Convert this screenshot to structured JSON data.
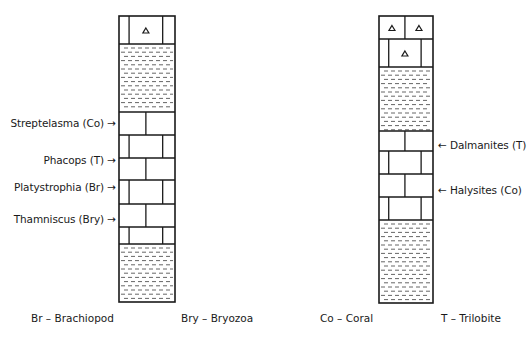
{
  "diagram": {
    "type": "stratigraphic-columns",
    "colors": {
      "line": "#1a1a1a",
      "shale_dash": "#555555",
      "background": "#ffffff"
    }
  },
  "columns": [
    {
      "id": "left",
      "layers": [
        {
          "rock": "limestone",
          "fossil_marker": true
        },
        {
          "rock": "shale"
        },
        {
          "rock": "limestone"
        },
        {
          "rock": "limestone"
        },
        {
          "rock": "limestone"
        },
        {
          "rock": "limestone"
        },
        {
          "rock": "limestone"
        },
        {
          "rock": "limestone"
        },
        {
          "rock": "shale"
        }
      ],
      "labels": [
        {
          "text": "Streptelasma (Co)",
          "arrow": "→"
        },
        {
          "text": "Phacops (T)",
          "arrow": "→"
        },
        {
          "text": "Platystrophia (Br)",
          "arrow": "→"
        },
        {
          "text": "Thamniscus (Bry)",
          "arrow": "→"
        }
      ]
    },
    {
      "id": "right",
      "layers": [
        {
          "rock": "limestone",
          "fossil_marker": true
        },
        {
          "rock": "limestone",
          "fossil_marker": true
        },
        {
          "rock": "shale"
        },
        {
          "rock": "limestone"
        },
        {
          "rock": "limestone"
        },
        {
          "rock": "limestone"
        },
        {
          "rock": "limestone"
        },
        {
          "rock": "shale"
        }
      ],
      "labels": [
        {
          "text": "Dalmanites (T)",
          "arrow": "←"
        },
        {
          "text": "Halysites (Co)",
          "arrow": "←"
        }
      ]
    }
  ],
  "legend": [
    {
      "text": "Br – Brachiopod"
    },
    {
      "text": "Bry – Bryozoa"
    },
    {
      "text": "Co – Coral"
    },
    {
      "text": "T – Trilobite"
    }
  ]
}
